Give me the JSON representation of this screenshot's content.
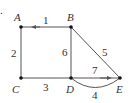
{
  "diagram": {
    "marker": ".",
    "nodes": [
      {
        "id": "A",
        "label": "A",
        "x": 21,
        "y": 27
      },
      {
        "id": "B",
        "label": "B",
        "x": 71,
        "y": 27
      },
      {
        "id": "C",
        "label": "C",
        "x": 21,
        "y": 78
      },
      {
        "id": "D",
        "label": "D",
        "x": 71,
        "y": 78
      },
      {
        "id": "E",
        "label": "E",
        "x": 120,
        "y": 78
      }
    ],
    "edges": [
      {
        "from": "B",
        "to": "A",
        "label": "1",
        "directed": true
      },
      {
        "from": "A",
        "to": "C",
        "label": "2",
        "directed": false
      },
      {
        "from": "C",
        "to": "D",
        "label": "3",
        "directed": false
      },
      {
        "from": "D",
        "to": "E",
        "label": "4",
        "directed": false,
        "curved": true
      },
      {
        "from": "B",
        "to": "E",
        "label": "5",
        "directed": false
      },
      {
        "from": "B",
        "to": "D",
        "label": "6",
        "directed": false
      },
      {
        "from": "D",
        "to": "E",
        "label": "7",
        "directed": true
      }
    ],
    "colors": {
      "edge": "#555555",
      "node": "#111111",
      "text": "#333333"
    }
  }
}
